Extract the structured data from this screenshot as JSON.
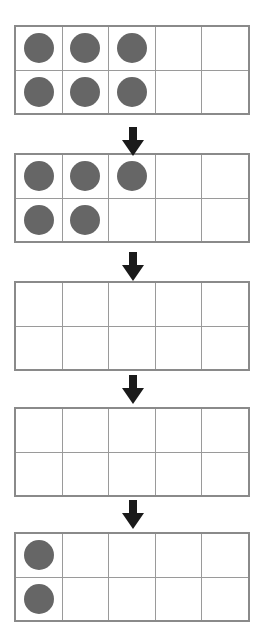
{
  "worksheet": {
    "title": "Ten Frame Counting Sequence",
    "type": "ten-frame-sequence",
    "frame_count": 5,
    "arrow_count": 4,
    "columns": 5,
    "rows": 2,
    "cells_per_frame": 10,
    "colors": {
      "dot": "#666666",
      "grid_line": "#9a9a9a",
      "frame_border": "#8a8a8a",
      "arrow": "#1a1a1a",
      "background": "#ffffff"
    },
    "frames": [
      {
        "name": "ten-frame-1",
        "total_dots": 6,
        "top": 25,
        "rows": [
          {
            "name": "top-row",
            "cells": [
              true,
              true,
              true,
              false,
              false
            ]
          },
          {
            "name": "bottom-row",
            "cells": [
              true,
              true,
              true,
              false,
              false
            ]
          }
        ]
      },
      {
        "name": "ten-frame-2",
        "total_dots": 5,
        "top": 153,
        "rows": [
          {
            "name": "top-row",
            "cells": [
              true,
              true,
              true,
              false,
              false
            ]
          },
          {
            "name": "bottom-row",
            "cells": [
              true,
              true,
              false,
              false,
              false
            ]
          }
        ]
      },
      {
        "name": "ten-frame-3",
        "total_dots": 0,
        "top": 281,
        "rows": [
          {
            "name": "top-row",
            "cells": [
              false,
              false,
              false,
              false,
              false
            ]
          },
          {
            "name": "bottom-row",
            "cells": [
              false,
              false,
              false,
              false,
              false
            ]
          }
        ]
      },
      {
        "name": "ten-frame-4",
        "total_dots": 0,
        "top": 407,
        "rows": [
          {
            "name": "top-row",
            "cells": [
              false,
              false,
              false,
              false,
              false
            ]
          },
          {
            "name": "bottom-row",
            "cells": [
              false,
              false,
              false,
              false,
              false
            ]
          }
        ]
      },
      {
        "name": "ten-frame-5",
        "total_dots": 2,
        "top": 532,
        "rows": [
          {
            "name": "top-row",
            "cells": [
              true,
              false,
              false,
              false,
              false
            ]
          },
          {
            "name": "bottom-row",
            "cells": [
              true,
              false,
              false,
              false,
              false
            ]
          }
        ]
      }
    ],
    "arrows": [
      {
        "name": "arrow-1",
        "icon": "arrow-down-icon",
        "top": 127
      },
      {
        "name": "arrow-2",
        "icon": "arrow-down-icon",
        "top": 252
      },
      {
        "name": "arrow-3",
        "icon": "arrow-down-icon",
        "top": 375
      },
      {
        "name": "arrow-4",
        "icon": "arrow-down-icon",
        "top": 500
      }
    ]
  }
}
